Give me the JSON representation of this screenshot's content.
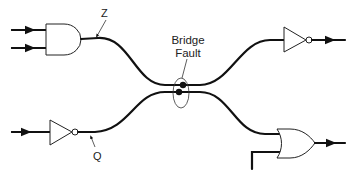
{
  "diagram": {
    "type": "logic-circuit",
    "labels": {
      "net_z": "Z",
      "net_q": "Q",
      "fault_line1": "Bridge",
      "fault_line2": "Fault"
    },
    "gates": [
      {
        "id": "and1",
        "kind": "AND",
        "inputs": 2,
        "position": "top-left"
      },
      {
        "id": "not1",
        "kind": "NOT",
        "inputs": 1,
        "position": "bottom-left"
      },
      {
        "id": "not2",
        "kind": "NOT",
        "inputs": 1,
        "position": "top-right"
      },
      {
        "id": "or1",
        "kind": "OR",
        "inputs": 2,
        "position": "bottom-right"
      }
    ],
    "nets": [
      {
        "name": "Z",
        "from": "and1",
        "to": "not2"
      },
      {
        "name": "Q",
        "from": "not1",
        "to": "or1"
      }
    ],
    "fault": {
      "type": "bridge",
      "between": [
        "Z",
        "Q"
      ]
    },
    "colors": {
      "line": "#111111",
      "background": "#ffffff"
    }
  }
}
